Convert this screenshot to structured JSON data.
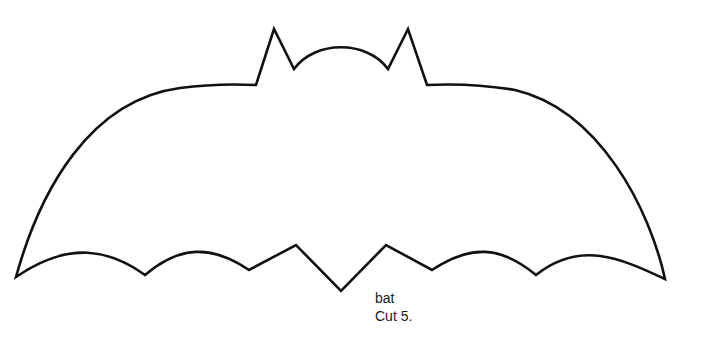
{
  "figure": {
    "subject": "bat",
    "outline_color": "#111111",
    "background_color": "#ffffff"
  },
  "caption": {
    "name": "bat",
    "instruction": "Cut 5."
  }
}
